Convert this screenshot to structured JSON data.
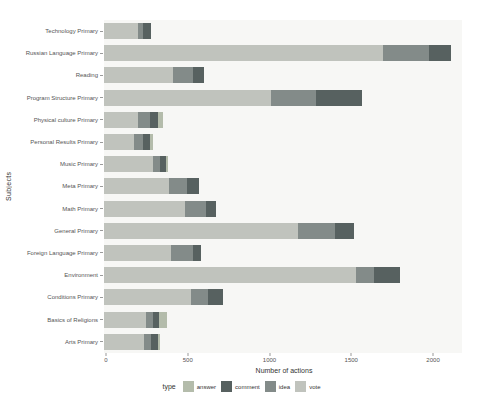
{
  "figure": {
    "x_axis_title": "Number of actions",
    "y_axis_title": "Subjects",
    "legend_title": "type"
  },
  "chart_data": {
    "type": "bar",
    "orientation": "horizontal",
    "stacked": true,
    "title": "",
    "xlabel": "Number of actions",
    "ylabel": "Subjects",
    "x_ticks": [
      0,
      500,
      1000,
      1500,
      2000
    ],
    "x_max": 2177,
    "grid": false,
    "categories": [
      "Technology Primary",
      "Russian Language Primary",
      "Reading",
      "Program Structure Primary",
      "Physical culture Primary",
      "Personal Results Primary",
      "Music Primary",
      "Meta Primary",
      "Math Primary",
      "General Primary",
      "Foreign Language Primary",
      "Environment",
      "Conditions Primary",
      "Basics of Religions",
      "Arts Primary"
    ],
    "series": [
      {
        "name": "answer",
        "color": "#b4bcab",
        "values": [
          0,
          0,
          0,
          0,
          30,
          20,
          10,
          0,
          0,
          0,
          0,
          0,
          0,
          50,
          15
        ]
      },
      {
        "name": "comment",
        "color": "#576160",
        "values": [
          45,
          130,
          65,
          285,
          50,
          40,
          35,
          70,
          60,
          120,
          50,
          160,
          90,
          35,
          40
        ]
      },
      {
        "name": "idea",
        "color": "#838b89",
        "values": [
          30,
          285,
          125,
          275,
          70,
          55,
          45,
          110,
          130,
          225,
          135,
          110,
          100,
          45,
          45
        ]
      },
      {
        "name": "vote",
        "color": "#c0c3bd",
        "values": [
          210,
          1705,
          420,
          1020,
          210,
          185,
          300,
          400,
          495,
          1185,
          410,
          1540,
          535,
          255,
          245
        ]
      }
    ],
    "stack_order_from_zero": [
      "vote",
      "idea",
      "comment",
      "answer"
    ],
    "legend": {
      "title": "type",
      "position": "bottom",
      "entries": [
        "answer",
        "comment",
        "idea",
        "vote"
      ]
    }
  }
}
